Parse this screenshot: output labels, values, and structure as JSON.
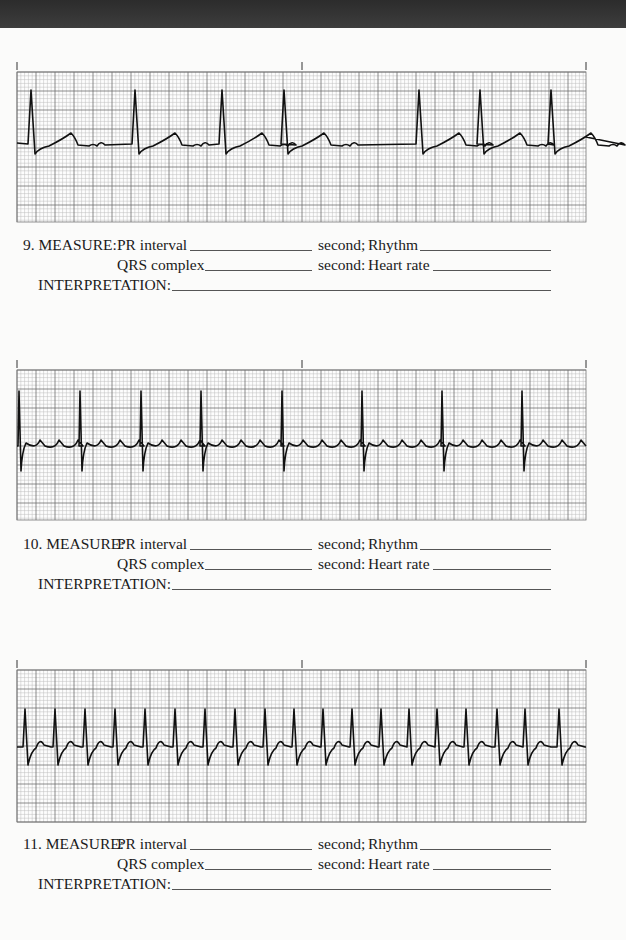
{
  "page": {
    "background": "#fbfbfa",
    "top_band_color": "#333333"
  },
  "grid": {
    "small_square_px": 3.8,
    "large_square_px": 19,
    "minor_color": "#bdbdbd",
    "major_color": "#6f6f6f",
    "trace_color": "#111111"
  },
  "strips": [
    {
      "number": "9",
      "top": 62,
      "grid_top": 72,
      "grid_bottom": 222,
      "left": 17,
      "right": 586,
      "baseline": 143,
      "tick_marks_x": [
        17,
        302,
        586
      ],
      "beats_x": [
        31,
        135,
        222,
        284,
        419,
        480,
        551
      ],
      "pattern": "sinus-with-flutter-like-baseline",
      "labels": {
        "measure": "9. MEASURE:",
        "pr_interval": "PR interval",
        "second_semi": "second;",
        "rhythm": "Rhythm",
        "qrs_complex": "QRS complex",
        "second_colon": "second:",
        "heart_rate": "Heart rate",
        "interpretation": "INTERPRETATION:"
      },
      "answers": {
        "pr_interval": "",
        "rhythm": "",
        "qrs_complex": "",
        "heart_rate": "",
        "interpretation": ""
      }
    },
    {
      "number": "10",
      "top": 360,
      "grid_top": 370,
      "grid_bottom": 520,
      "left": 17,
      "right": 586,
      "baseline": 446,
      "tick_marks_x": [
        17,
        302,
        586
      ],
      "beats_x": [
        19,
        80,
        141,
        201,
        282,
        362,
        442,
        522
      ],
      "pattern": "atrial-flutter-sawtooth",
      "labels": {
        "measure": "10. MEASURE:",
        "pr_interval": "PR interval",
        "second_semi": "second;",
        "rhythm": "Rhythm",
        "qrs_complex": "QRS complex",
        "second_colon": "second:",
        "heart_rate": "Heart rate",
        "interpretation": "INTERPRETATION:"
      },
      "answers": {
        "pr_interval": "",
        "rhythm": "",
        "qrs_complex": "",
        "heart_rate": "",
        "interpretation": ""
      }
    },
    {
      "number": "11",
      "top": 660,
      "grid_top": 670,
      "grid_bottom": 822,
      "left": 17,
      "right": 586,
      "baseline": 747,
      "tick_marks_x": [
        17,
        302,
        586
      ],
      "beats_x": [
        25,
        55,
        85,
        115,
        145,
        175,
        205,
        235,
        265,
        294,
        323,
        352,
        381,
        409,
        437,
        466,
        497,
        525,
        559
      ],
      "pattern": "regular-tachycardia",
      "labels": {
        "measure": "11. MEASURE:",
        "pr_interval": "PR interval",
        "second_semi": "second;",
        "rhythm": "Rhythm",
        "qrs_complex": "QRS complex",
        "second_colon": "second:",
        "heart_rate": "Heart rate",
        "interpretation": "INTERPRETATION:"
      },
      "answers": {
        "pr_interval": "",
        "rhythm": "",
        "qrs_complex": "",
        "heart_rate": "",
        "interpretation": ""
      }
    }
  ],
  "measure_blocks_top": [
    236,
    535,
    835
  ]
}
